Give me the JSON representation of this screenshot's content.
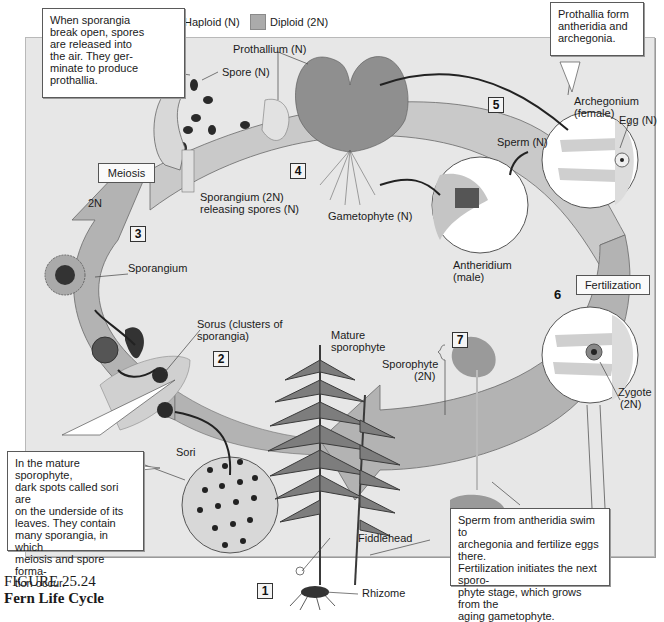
{
  "legend": {
    "haploid": {
      "label": "Haploid (N)",
      "color": "#c6c6c6"
    },
    "diploid": {
      "label": "Diploid (2N)",
      "color": "#aeaeae"
    }
  },
  "callouts": {
    "spores_released": "When sporangia break open, spores are released into the air. They germinate to produce prothallia.",
    "spores_released_lines": [
      "When sporangia",
      "break open, spores",
      "are released into",
      "the air. They ger-",
      "minate to produce",
      "prothallia."
    ],
    "prothallia_form_lines": [
      "Prothallia form",
      "antheridia and",
      "archegonia."
    ],
    "mature_sporophyte_lines": [
      "In the mature sporophyte,",
      "dark spots called sori are",
      "on the underside of its",
      "leaves. They contain",
      "many sporangia, in which",
      "meiosis and spore forma-",
      "tion occur."
    ],
    "fertilization_lines": [
      "Sperm from antheridia swim to",
      "archegonia and fertilize eggs there.",
      "Fertilization initiates the next sporo-",
      "phyte stage, which grows from the",
      "aging gametophyte."
    ]
  },
  "labels": {
    "prothallium": "Prothallium (N)",
    "spore": "Spore (N)",
    "sporangium_releasing_1": "Sporangium (2N)",
    "sporangium_releasing_2": "releasing spores (N)",
    "gametophyte": "Gametophyte (N)",
    "archegonium_1": "Archegonium",
    "archegonium_2": "(female)",
    "egg": "Egg (N)",
    "sperm": "Sperm (N)",
    "antheridium_1": "Antheridium",
    "antheridium_2": "(male)",
    "sporangium": "Sporangium",
    "sorus_1": "Sorus (clusters of",
    "sorus_2": "sporangia)",
    "mature_sporophyte_1": "Mature",
    "mature_sporophyte_2": "sporophyte",
    "sporophyte_1": "Sporophyte",
    "sporophyte_2": "(2N)",
    "zygote_1": "Zygote",
    "zygote_2": "(2N)",
    "sori": "Sori",
    "fiddlehead": "Fiddlehead",
    "rhizome": "Rhizome",
    "two_n": "2N"
  },
  "stage_tags": {
    "meiosis": "Meiosis",
    "fertilization": "Fertilization"
  },
  "steps": {
    "s1": "1",
    "s2": "2",
    "s3": "3",
    "s4": "4",
    "s5": "5",
    "s6": "6",
    "s7": "7"
  },
  "caption": {
    "figure": "FIGURE 25.24",
    "title": "Fern Life Cycle"
  }
}
